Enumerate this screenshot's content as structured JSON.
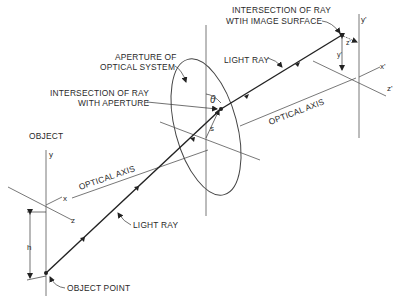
{
  "diagram": {
    "labels": {
      "image_intersection_line1": "INTERSECTION OF RAY",
      "image_intersection_line2": "WTIH IMAGE SURFACE",
      "aperture_line1": "APERTURE OF",
      "aperture_line2": "OPTICAL SYSTEM",
      "aperture_intersection_line1": "INTERSECTION OF RAY",
      "aperture_intersection_line2": "WITH APERTURE",
      "light_ray_upper": "LIGHT RAY",
      "light_ray_lower": "LIGHT RAY",
      "optical_axis_image_side": "OPTICAL AXIS",
      "optical_axis_object_side": "OPTICAL AXIS",
      "object": "OBJECT",
      "object_point": "OBJECT POINT"
    },
    "symbols": {
      "object_y": "y",
      "object_x": "x",
      "object_z": "z",
      "object_h": "h",
      "aperture_theta": "θ",
      "aperture_s": "s",
      "image_y": "y'",
      "image_x": "x'",
      "image_z": "z'",
      "image_y_offset": "y'",
      "image_z_offset": "z'"
    }
  }
}
